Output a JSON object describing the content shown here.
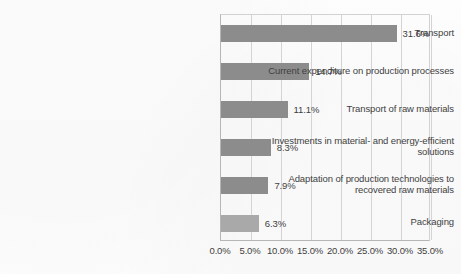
{
  "chart_data": {
    "type": "bar",
    "orientation": "horizontal",
    "title": "",
    "subtitle": "",
    "xlabel": "",
    "ylabel": "",
    "xlim": [
      0,
      35
    ],
    "xtick_labels": [
      "0.0%",
      "5.0%",
      "10.0%",
      "15.0%",
      "20.0%",
      "25.0%",
      "30.0%",
      "35.0%"
    ],
    "xtick_values": [
      0,
      5,
      10,
      15,
      20,
      25,
      30,
      35
    ],
    "grid": "vertical",
    "legend": "none",
    "categories": [
      "Transport",
      "Current expenditure on production processes",
      "Transport of raw materials",
      "Investments in material- and energy-efficient solutions",
      "Adaptation of production technologies to recovered raw materials",
      "Packaging"
    ],
    "values": [
      31.6,
      14.7,
      11.1,
      8.3,
      7.9,
      6.3
    ],
    "data_labels": [
      "31.6%",
      "14.7%",
      "11.1%",
      "8.3%",
      "7.9%",
      "6.3%"
    ],
    "bar_color": "#8c8c8c",
    "last_bar_color": "#a9a9a9"
  },
  "categories_wrapped": [
    [
      "Transport"
    ],
    [
      "Current expenditure on production processes"
    ],
    [
      "Transport of raw materials"
    ],
    [
      "Investments in material- and energy-efficient",
      "solutions"
    ],
    [
      "Adaptation of production technologies to",
      "recovered raw materials"
    ],
    [
      "Packaging"
    ]
  ]
}
